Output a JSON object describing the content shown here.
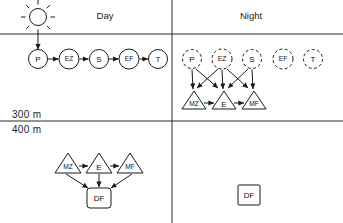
{
  "figure": {
    "title_day": "Day",
    "title_night": "Night",
    "depth_upper": "300 m",
    "depth_lower": "400 m"
  },
  "diagram_data": {
    "type": "diagram",
    "panels": [
      {
        "id": "day-upper",
        "label": "Day",
        "zone": "above-300m",
        "nodes": [
          {
            "id": "P",
            "label": "P",
            "shape": "circle",
            "style": "solid",
            "cx": 38,
            "cy": 59
          },
          {
            "id": "EZ",
            "label": "EZ",
            "shape": "circle",
            "style": "solid",
            "cx": 69,
            "cy": 59
          },
          {
            "id": "S",
            "label": "S",
            "shape": "circle",
            "style": "solid",
            "cx": 99,
            "cy": 59
          },
          {
            "id": "EF",
            "label": "EF",
            "shape": "circle",
            "style": "solid",
            "cx": 129,
            "cy": 59
          },
          {
            "id": "T",
            "label": "T",
            "shape": "circle",
            "style": "solid",
            "cx": 158,
            "cy": 59
          }
        ],
        "edges": [
          {
            "from": "sun",
            "to": "P",
            "kind": "arrow"
          },
          {
            "from": "P",
            "to": "EZ",
            "kind": "arrow"
          },
          {
            "from": "EZ",
            "to": "S",
            "kind": "arrow"
          },
          {
            "from": "S",
            "to": "EF",
            "kind": "arrow"
          },
          {
            "from": "EF",
            "to": "T",
            "kind": "arrow"
          }
        ],
        "icons": [
          {
            "id": "sun",
            "name": "sun-icon",
            "cx": 38,
            "cy": 17,
            "rays": 8
          }
        ]
      },
      {
        "id": "night-upper",
        "label": "Night",
        "zone": "above-300m",
        "nodes": [
          {
            "id": "P",
            "label": "P",
            "shape": "circle",
            "style": "dashed",
            "cx": 192,
            "cy": 59
          },
          {
            "id": "EZ",
            "label": "EZ",
            "shape": "circle",
            "style": "dashed",
            "cx": 222,
            "cy": 59
          },
          {
            "id": "S",
            "label": "S",
            "shape": "circle",
            "style": "dashed",
            "cx": 252,
            "cy": 59
          },
          {
            "id": "EF",
            "label": "EF",
            "shape": "circle",
            "style": "dashed",
            "cx": 283,
            "cy": 59
          },
          {
            "id": "T",
            "label": "T",
            "shape": "circle",
            "style": "dashed",
            "cx": 313,
            "cy": 59
          },
          {
            "id": "MZ",
            "label": "MZ",
            "shape": "triangle",
            "style": "solid",
            "cx": 194,
            "cy": 100
          },
          {
            "id": "E",
            "label": "E",
            "shape": "triangle",
            "style": "solid",
            "cx": 224,
            "cy": 100
          },
          {
            "id": "MF",
            "label": "MF",
            "shape": "triangle",
            "style": "solid",
            "cx": 254,
            "cy": 100
          }
        ],
        "edges": [
          {
            "from": "P",
            "to": "MZ",
            "kind": "arrow"
          },
          {
            "from": "P",
            "to": "E",
            "kind": "arrow"
          },
          {
            "from": "EZ",
            "to": "MZ",
            "kind": "arrow"
          },
          {
            "from": "EZ",
            "to": "E",
            "kind": "arrow"
          },
          {
            "from": "EZ",
            "to": "MF",
            "kind": "arrow"
          },
          {
            "from": "S",
            "to": "E",
            "kind": "arrow"
          },
          {
            "from": "S",
            "to": "MF",
            "kind": "arrow"
          },
          {
            "from": "MZ",
            "to": "E",
            "kind": "arrow"
          },
          {
            "from": "E",
            "to": "MF",
            "kind": "arrow"
          }
        ],
        "icons": []
      },
      {
        "id": "day-lower",
        "label": "Day",
        "zone": "below-400m",
        "nodes": [
          {
            "id": "MZ",
            "label": "MZ",
            "shape": "triangle",
            "style": "solid",
            "cx": 68,
            "cy": 163
          },
          {
            "id": "E",
            "label": "E",
            "shape": "triangle",
            "style": "solid",
            "cx": 99,
            "cy": 163
          },
          {
            "id": "MF",
            "label": "MF",
            "shape": "triangle",
            "style": "solid",
            "cx": 130,
            "cy": 163
          },
          {
            "id": "DF",
            "label": "DF",
            "shape": "rounded-square",
            "style": "solid",
            "cx": 99,
            "cy": 196
          }
        ],
        "edges": [
          {
            "from": "MZ",
            "to": "E",
            "kind": "arrow"
          },
          {
            "from": "E",
            "to": "MF",
            "kind": "arrow"
          },
          {
            "from": "MZ",
            "to": "DF",
            "kind": "arrow"
          },
          {
            "from": "E",
            "to": "DF",
            "kind": "arrow"
          },
          {
            "from": "MF",
            "to": "DF",
            "kind": "arrow"
          }
        ],
        "icons": []
      },
      {
        "id": "night-lower",
        "label": "Night",
        "zone": "below-400m",
        "nodes": [
          {
            "id": "DF",
            "label": "DF",
            "shape": "rounded-square",
            "style": "solid",
            "cx": 249,
            "cy": 195
          }
        ],
        "edges": [],
        "icons": []
      }
    ],
    "rules": [
      {
        "id": "vertical-divider",
        "x1": 172,
        "y1": 0,
        "x2": 172,
        "y2": 223
      },
      {
        "id": "rule-top",
        "x1": 0,
        "y1": 34,
        "x2": 343,
        "y2": 34
      },
      {
        "id": "rule-300m",
        "x1": 0,
        "y1": 121,
        "x2": 343,
        "y2": 121
      }
    ]
  }
}
